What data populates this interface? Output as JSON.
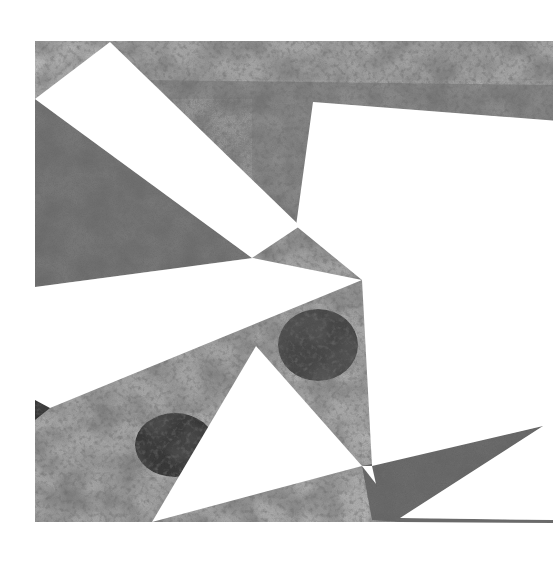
{
  "artwork": {
    "title": "Abstract grayscale collage with white triangular cutouts",
    "canvas": {
      "width": 559,
      "height": 568,
      "background": "#ffffff"
    },
    "painting_bounds": {
      "x": 35,
      "y": 41,
      "width": 518,
      "height": 481
    },
    "palette": {
      "light_gray": "#c4c4c4",
      "mid_gray": "#9a9a9a",
      "sky_gray": "#a8a8a8",
      "dark_gray": "#555555",
      "near_black": "#262626",
      "cutout_white": "#ffffff"
    },
    "cutouts": [
      {
        "name": "top-left-wedge",
        "points": "35,99 110,42 300,226 252,258"
      },
      {
        "name": "right-large-panel",
        "points": "313,102 553,121 553,522 400,522 543,426 372,466 362,280 296,226"
      },
      {
        "name": "left-middle-band",
        "points": "35,287 253,258 362,280 50,408"
      },
      {
        "name": "center-triangle",
        "points": "256,346 362,466 152,522"
      },
      {
        "name": "bottom-left-strip",
        "points": "35,522 152,522 140,530 35,530"
      }
    ]
  }
}
